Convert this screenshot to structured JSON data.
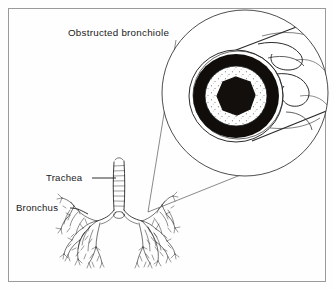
{
  "figure": {
    "title": "Obstructed bronchiole",
    "labels": {
      "trachea": "Trachea",
      "bronchus": "Bronchus"
    },
    "colors": {
      "background": "#fefefe",
      "border": "#9a9a9a",
      "ink": "#1a1a1a",
      "line": "#2b2b2b",
      "muscle_ring": "#100d0b",
      "mucus_plug": "#120f0d",
      "mucosa": "#ffffff",
      "stipple": "#4a4a4a",
      "leader": "#3a3a3a"
    },
    "border": {
      "inset": 8,
      "stroke_width": 1
    },
    "title_position": {
      "x": 68,
      "y": 36
    },
    "magnifier_circle": {
      "cx": 245,
      "cy": 93,
      "r": 83,
      "stroke_width": 0.9
    },
    "cross_section": {
      "cx": 236,
      "cy": 96,
      "outer_wall_radius": 46,
      "muscle_outer_radius": 43,
      "muscle_inner_radius": 31,
      "mucosa_radius": 31,
      "plug_radius": 19,
      "description": "bronchiole cut in cross-section with thickened muscular wall, stippled mucosa and central mucus plug"
    },
    "leader_lines": [
      {
        "name": "upper-leader",
        "x1": 148,
        "y1": 212,
        "x2": 176,
        "y2": 40
      },
      {
        "name": "lower-leader",
        "x1": 148,
        "y1": 212,
        "x2": 246,
        "y2": 176
      }
    ],
    "trachea_callout": {
      "text_x": 46,
      "text_y": 181,
      "line_x1": 92,
      "line_y1": 178,
      "line_x2": 118,
      "line_y2": 178
    },
    "bronchus_callout": {
      "text_x": 16,
      "text_y": 211,
      "line_x1": 70,
      "line_y1": 208,
      "line_x2": 88,
      "line_y2": 213
    },
    "lung_tree": {
      "trachea_top_y": 162,
      "carina_y": 216,
      "bottom_y": 268,
      "left_x": 72,
      "right_x": 148
    }
  }
}
